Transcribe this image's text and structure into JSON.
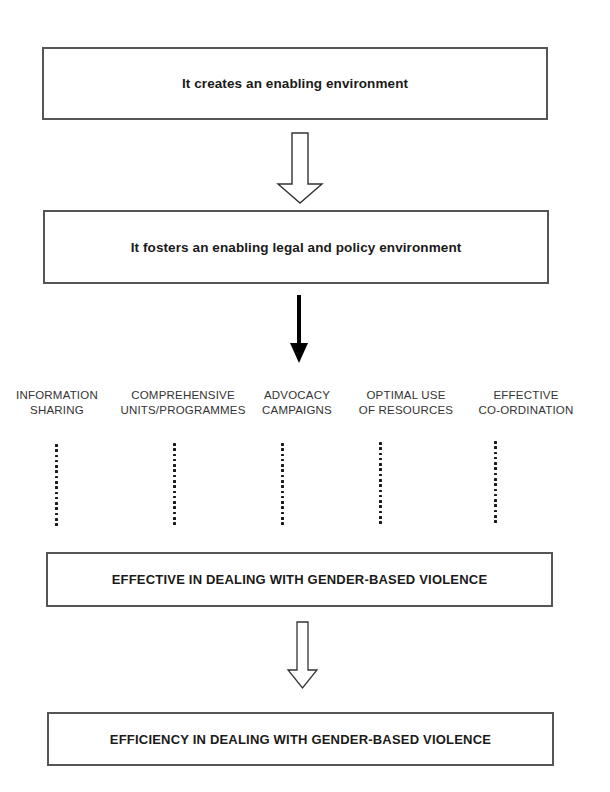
{
  "diagram": {
    "type": "flowchart",
    "boxes": [
      {
        "id": "box1",
        "text": "It creates an enabling environment"
      },
      {
        "id": "box2",
        "text": "It fosters an enabling legal and policy environment"
      },
      {
        "id": "box3",
        "text": "EFFECTIVE IN DEALING WITH GENDER-BASED VIOLENCE"
      },
      {
        "id": "box4",
        "text": "EFFICIENCY IN DEALING WITH GENDER-BASED VIOLENCE"
      }
    ],
    "components": [
      {
        "line1": "INFORMATION",
        "line2": "SHARING"
      },
      {
        "line1": "COMPREHENSIVE",
        "line2": "UNITS/PROGRAMMES"
      },
      {
        "line1": "ADVOCACY",
        "line2": "CAMPAIGNS"
      },
      {
        "line1": "OPTIMAL USE",
        "line2": "OF RESOURCES"
      },
      {
        "line1": "EFFECTIVE",
        "line2": "CO-ORDINATION"
      }
    ],
    "arrows": [
      {
        "from": "box1",
        "to": "box2",
        "style": "outline",
        "icon": "hollow-down-arrow"
      },
      {
        "from": "box2",
        "to": "components",
        "style": "solid",
        "icon": "solid-down-arrow"
      },
      {
        "from": "components",
        "to": "box3",
        "style": "dotted",
        "icon": "dotted-line"
      },
      {
        "from": "box3",
        "to": "box4",
        "style": "outline",
        "icon": "hollow-down-arrow"
      }
    ],
    "colors": {
      "border": "#555555",
      "text": "#1a1a1a",
      "arrow_fill": "#000000",
      "background": "#ffffff"
    }
  }
}
